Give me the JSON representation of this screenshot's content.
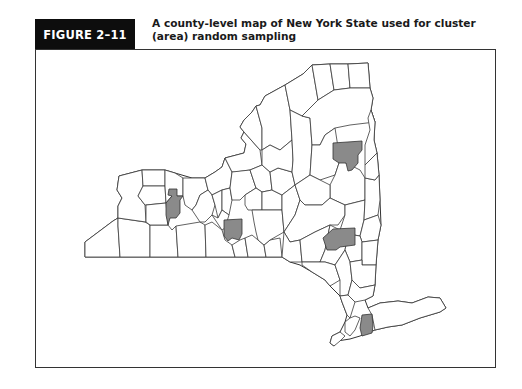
{
  "figure": {
    "label": "FIGURE 2–11",
    "title_line1": "A county-level map of New York State used for cluster",
    "title_line2": "(area) random sampling"
  },
  "map": {
    "region": "New York State",
    "division": "county",
    "highlighted_counties_count": 5,
    "colors": {
      "label_bg": "#0d0d0d",
      "county_fill": "#ffffff",
      "county_stroke": "#3a3a3a",
      "selected_fill": "#8a8a8a",
      "frame": "#333333"
    }
  }
}
